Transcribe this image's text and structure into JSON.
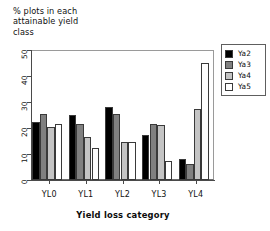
{
  "chart_data": {
    "type": "bar",
    "title": "% plots in each\nattainable  yield\nclass",
    "xlabel": "Yield loss category",
    "ylabel": "",
    "categories": [
      "YL0",
      "YL1",
      "YL2",
      "YL3",
      "YL4"
    ],
    "series": [
      {
        "name": "Ya2",
        "color": "#000000",
        "values": [
          22.5,
          25.0,
          28.0,
          17.5,
          8.0
        ]
      },
      {
        "name": "Ya3",
        "color": "#808080",
        "values": [
          25.5,
          21.5,
          25.5,
          21.5,
          6.0
        ]
      },
      {
        "name": "Ya4",
        "color": "#c4c4c4",
        "values": [
          20.5,
          16.5,
          14.5,
          21.0,
          27.5
        ]
      },
      {
        "name": "Ya5",
        "color": "#ffffff",
        "values": [
          21.5,
          12.5,
          14.5,
          7.5,
          45.0
        ]
      }
    ],
    "ylim": [
      0,
      50
    ],
    "yticks": [
      0,
      10,
      20,
      30,
      40,
      50
    ],
    "ytick_labels": [
      "0",
      "10",
      "20",
      "30",
      "40",
      "50"
    ],
    "grid": false,
    "legend_position": "right-top"
  }
}
